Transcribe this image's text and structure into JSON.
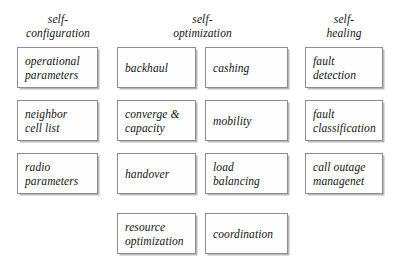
{
  "diagram": {
    "background_color": "#ffffff",
    "box_border_color": "#8d8d8d",
    "box_fill_color": "#fefefe",
    "box_shadow_color": "#b9b9b9",
    "text_color": "#141414",
    "columns": [
      {
        "id": "self-configuration",
        "header": "self-\nconfiguration",
        "header_line1": "self-",
        "header_line2": "configuration",
        "nodes": [
          {
            "id": "operational-parameters",
            "label": "operational\nparameters"
          },
          {
            "id": "neighbor-cell-list",
            "label": "neighbor\ncell list"
          },
          {
            "id": "radio-parameters",
            "label": "radio\nparameters"
          }
        ]
      },
      {
        "id": "self-optimization",
        "header": "self-\noptimization",
        "header_line1": "self-",
        "header_line2": "optimization",
        "nodes": [
          {
            "id": "backhaul",
            "label": "backhaul"
          },
          {
            "id": "cashing",
            "label": "cashing"
          },
          {
            "id": "converge-capacity",
            "label": "converge &\ncapacity"
          },
          {
            "id": "mobility",
            "label": "mobility"
          },
          {
            "id": "handover",
            "label": "handover"
          },
          {
            "id": "load-balancing",
            "label": "load\nbalancing"
          },
          {
            "id": "resource-optimization",
            "label": "resource\noptimization"
          },
          {
            "id": "coordination",
            "label": "coordination"
          }
        ]
      },
      {
        "id": "self-healing",
        "header": "self-\nhealing",
        "header_line1": "self-",
        "header_line2": "healing",
        "nodes": [
          {
            "id": "fault-detection",
            "label": "fault\ndetection"
          },
          {
            "id": "fault-classification",
            "label": "fault\nclassification"
          },
          {
            "id": "call-outage-managenet",
            "label": "call outage\nmanagenet"
          }
        ]
      }
    ]
  }
}
